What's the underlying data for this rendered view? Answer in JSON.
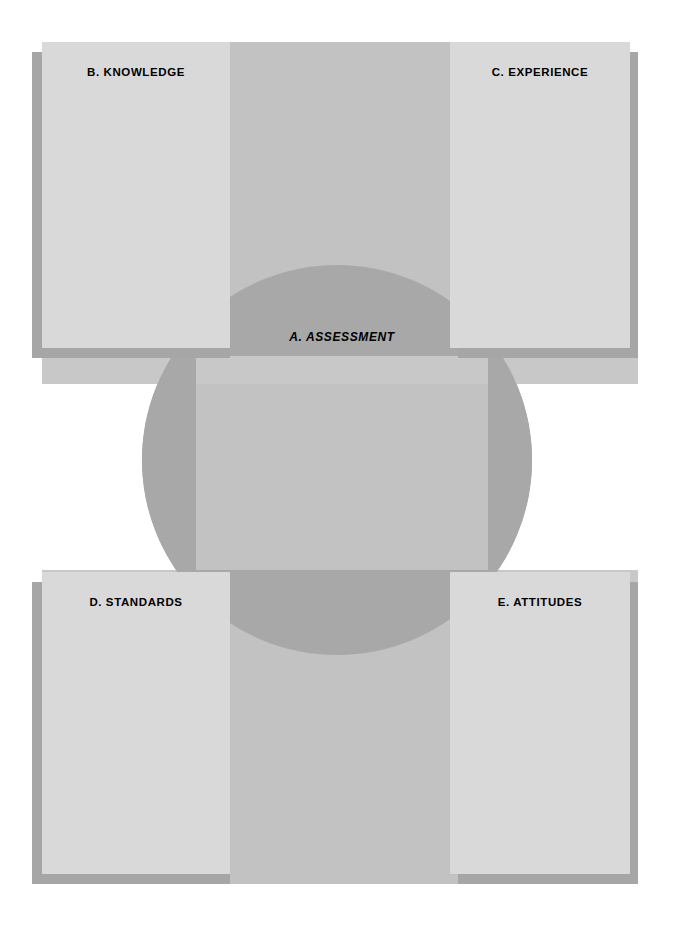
{
  "diagram": {
    "type": "venn-overlap-quadrant",
    "center": {
      "id": "A",
      "label": "A.  ASSESSMENT",
      "letter": "A",
      "name": "ASSESSMENT",
      "style": "bold-italic",
      "shape": "circle"
    },
    "quadrants": [
      {
        "id": "B",
        "label": "B.  KNOWLEDGE",
        "letter": "B",
        "name": "KNOWLEDGE",
        "position": "top-left",
        "shadow_side": "left"
      },
      {
        "id": "C",
        "label": "C.  EXPERIENCE",
        "letter": "C",
        "name": "EXPERIENCE",
        "position": "top-right",
        "shadow_side": "right"
      },
      {
        "id": "D",
        "label": "D.  STANDARDS",
        "letter": "D",
        "name": "STANDARDS",
        "position": "bottom-left",
        "shadow_side": "left"
      },
      {
        "id": "E",
        "label": "E.  ATTITUDES",
        "letter": "E",
        "name": "ATTITUDES",
        "position": "bottom-right",
        "shadow_side": "right"
      }
    ],
    "colors": {
      "background": "#ffffff",
      "circle": "#a8a8a8",
      "vertical_band": "#c2c2c2",
      "horizontal_band": "#c8c8c8",
      "box_fill": "#d9d9d9",
      "box_shadow": "#a6a6a6",
      "text": "#000000"
    }
  }
}
